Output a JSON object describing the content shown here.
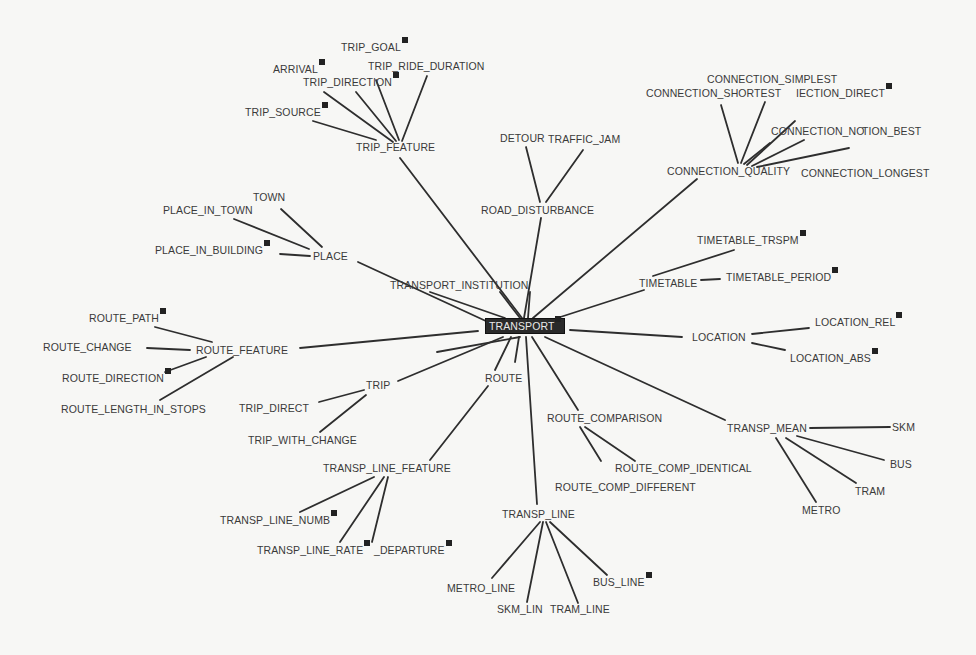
{
  "diagram": {
    "type": "concept-graph",
    "root": "TRANSPORT",
    "nodes": [
      {
        "id": "transport",
        "label": "TRANSPORT",
        "x": 485,
        "y": 326,
        "root": true,
        "badge": true
      },
      {
        "id": "trip_feature",
        "label": "TRIP_FEATURE",
        "x": 356,
        "y": 147
      },
      {
        "id": "trip_goal",
        "label": "TRIP_GOAL",
        "x": 341,
        "y": 47,
        "badge": true
      },
      {
        "id": "arrival",
        "label": "ARRIVAL",
        "x": 273,
        "y": 69,
        "badge": true
      },
      {
        "id": "trip_ride_duration",
        "label": "TRIP_RIDE_DURATION",
        "x": 368,
        "y": 66
      },
      {
        "id": "trip_direction",
        "label": "TRIP_DIRECTION",
        "x": 303,
        "y": 82,
        "badge": true
      },
      {
        "id": "trip_source",
        "label": "TRIP_SOURCE",
        "x": 245,
        "y": 112,
        "badge": true
      },
      {
        "id": "detour",
        "label": "DETOUR",
        "x": 500,
        "y": 138
      },
      {
        "id": "traffic_jam",
        "label": "TRAFFIC_JAM",
        "x": 548,
        "y": 139
      },
      {
        "id": "road_disturbance",
        "label": "ROAD_DISTURBANCE",
        "x": 481,
        "y": 210
      },
      {
        "id": "connection_quality",
        "label": "CONNECTION_QUALITY",
        "x": 667,
        "y": 171
      },
      {
        "id": "connection_simplest",
        "label": "CONNECTION_SIMPLEST",
        "x": 707,
        "y": 79
      },
      {
        "id": "connection_shortest",
        "label": "CONNECTION_SHORTEST",
        "x": 646,
        "y": 93
      },
      {
        "id": "connection_direct",
        "label": "CONNECTION_DIRECT",
        "x": 796,
        "y": 93,
        "badge": true,
        "display": "IECTION_DIRECT"
      },
      {
        "id": "connection_no",
        "label": "CONNECTION_NO",
        "x": 771,
        "y": 131
      },
      {
        "id": "connection_best",
        "label": "CONNECTION_BEST",
        "x": 862,
        "y": 131,
        "display": "TION_BEST"
      },
      {
        "id": "connection_longest",
        "label": "CONNECTION_LONGEST",
        "x": 801,
        "y": 173
      },
      {
        "id": "town",
        "label": "TOWN",
        "x": 253,
        "y": 197
      },
      {
        "id": "place_in_town",
        "label": "PLACE_IN_TOWN",
        "x": 163,
        "y": 210
      },
      {
        "id": "place_in_building",
        "label": "PLACE_IN_BUILDING",
        "x": 155,
        "y": 250,
        "badge": true
      },
      {
        "id": "place",
        "label": "PLACE",
        "x": 313,
        "y": 256
      },
      {
        "id": "transport_institution",
        "label": "TRANSPORT_INSTITUTION",
        "x": 390,
        "y": 285
      },
      {
        "id": "timetable",
        "label": "TIMETABLE",
        "x": 639,
        "y": 283
      },
      {
        "id": "timetable_trspm",
        "label": "TIMETABLE_TRSPM",
        "x": 697,
        "y": 240,
        "badge": true
      },
      {
        "id": "timetable_period",
        "label": "TIMETABLE_PERIOD",
        "x": 726,
        "y": 277,
        "badge": true
      },
      {
        "id": "location",
        "label": "LOCATION",
        "x": 692,
        "y": 337
      },
      {
        "id": "location_rel",
        "label": "LOCATION_REL",
        "x": 815,
        "y": 322,
        "badge": true
      },
      {
        "id": "location_abs",
        "label": "LOCATION_ABS",
        "x": 790,
        "y": 358,
        "badge": true
      },
      {
        "id": "route_feature",
        "label": "ROUTE_FEATURE",
        "x": 196,
        "y": 350
      },
      {
        "id": "route_path",
        "label": "ROUTE_PATH",
        "x": 89,
        "y": 318,
        "badge": true
      },
      {
        "id": "route_change",
        "label": "ROUTE_CHANGE",
        "x": 43,
        "y": 347
      },
      {
        "id": "route_direction",
        "label": "ROUTE_DIRECTION",
        "x": 62,
        "y": 378,
        "badge": true
      },
      {
        "id": "route_length_in_stops",
        "label": "ROUTE_LENGTH_IN_STOPS",
        "x": 61,
        "y": 409
      },
      {
        "id": "route",
        "label": "ROUTE",
        "x": 485,
        "y": 378
      },
      {
        "id": "trip",
        "label": "TRIP",
        "x": 366,
        "y": 385
      },
      {
        "id": "trip_direct",
        "label": "TRIP_DIRECT",
        "x": 239,
        "y": 408
      },
      {
        "id": "trip_with_change",
        "label": "TRIP_WITH_CHANGE",
        "x": 248,
        "y": 440
      },
      {
        "id": "transp_line_feature",
        "label": "TRANSP_LINE_FEATURE",
        "x": 323,
        "y": 468
      },
      {
        "id": "transp_line_numb",
        "label": "TRANSP_LINE_NUMB",
        "x": 220,
        "y": 520,
        "badge": true
      },
      {
        "id": "transp_line_rate",
        "label": "TRANSP_LINE_RATE",
        "x": 257,
        "y": 550,
        "badge": true
      },
      {
        "id": "departure",
        "label": "DEPARTURE",
        "x": 374,
        "y": 550,
        "badge": true,
        "display": "_DEPARTURE"
      },
      {
        "id": "route_comparison",
        "label": "ROUTE_COMPARISON",
        "x": 547,
        "y": 418
      },
      {
        "id": "route_comp_identical",
        "label": "ROUTE_COMP_IDENTICAL",
        "x": 615,
        "y": 468
      },
      {
        "id": "route_comp_different",
        "label": "ROUTE_COMP_DIFFERENT",
        "x": 555,
        "y": 487
      },
      {
        "id": "transp_mean",
        "label": "TRANSP_MEAN",
        "x": 727,
        "y": 428
      },
      {
        "id": "skm",
        "label": "SKM",
        "x": 892,
        "y": 427
      },
      {
        "id": "bus",
        "label": "BUS",
        "x": 890,
        "y": 464
      },
      {
        "id": "tram",
        "label": "TRAM",
        "x": 855,
        "y": 491
      },
      {
        "id": "metro",
        "label": "METRO",
        "x": 802,
        "y": 510
      },
      {
        "id": "transp_line",
        "label": "TRANSP_LINE",
        "x": 502,
        "y": 514
      },
      {
        "id": "metro_line",
        "label": "METRO_LINE",
        "x": 447,
        "y": 588
      },
      {
        "id": "skm_line",
        "label": "SKM_LINE",
        "x": 497,
        "y": 609,
        "display": "SKM_LIN"
      },
      {
        "id": "tram_line",
        "label": "TRAM_LINE",
        "x": 550,
        "y": 609
      },
      {
        "id": "bus_line",
        "label": "BUS_LINE",
        "x": 593,
        "y": 582,
        "badge": true
      }
    ],
    "edges": [
      {
        "x1": 522,
        "y1": 318,
        "x2": 400,
        "y2": 158
      },
      {
        "x1": 524,
        "y1": 318,
        "x2": 541,
        "y2": 218
      },
      {
        "x1": 533,
        "y1": 318,
        "x2": 697,
        "y2": 179
      },
      {
        "x1": 505,
        "y1": 318,
        "x2": 430,
        "y2": 292
      },
      {
        "x1": 520,
        "y1": 318,
        "x2": 500,
        "y2": 292
      },
      {
        "x1": 528,
        "y1": 318,
        "x2": 530,
        "y2": 292
      },
      {
        "x1": 488,
        "y1": 322,
        "x2": 358,
        "y2": 262
      },
      {
        "x1": 548,
        "y1": 321,
        "x2": 644,
        "y2": 290
      },
      {
        "x1": 570,
        "y1": 330,
        "x2": 682,
        "y2": 337
      },
      {
        "x1": 478,
        "y1": 331,
        "x2": 300,
        "y2": 348
      },
      {
        "x1": 503,
        "y1": 337,
        "x2": 398,
        "y2": 381
      },
      {
        "x1": 511,
        "y1": 337,
        "x2": 495,
        "y2": 370
      },
      {
        "x1": 519,
        "y1": 337,
        "x2": 515,
        "y2": 362
      },
      {
        "x1": 526,
        "y1": 337,
        "x2": 537,
        "y2": 504
      },
      {
        "x1": 532,
        "y1": 337,
        "x2": 578,
        "y2": 410
      },
      {
        "x1": 545,
        "y1": 337,
        "x2": 725,
        "y2": 420
      },
      {
        "x1": 520,
        "y1": 337,
        "x2": 437,
        "y2": 352
      },
      {
        "x1": 488,
        "y1": 386,
        "x2": 430,
        "y2": 460
      },
      {
        "x1": 399,
        "y1": 140,
        "x2": 376,
        "y2": 80
      },
      {
        "x1": 396,
        "y1": 141,
        "x2": 356,
        "y2": 92
      },
      {
        "x1": 393,
        "y1": 142,
        "x2": 324,
        "y2": 92
      },
      {
        "x1": 402,
        "y1": 141,
        "x2": 427,
        "y2": 76
      },
      {
        "x1": 376,
        "y1": 140,
        "x2": 313,
        "y2": 121
      },
      {
        "x1": 540,
        "y1": 202,
        "x2": 526,
        "y2": 147
      },
      {
        "x1": 546,
        "y1": 202,
        "x2": 583,
        "y2": 150
      },
      {
        "x1": 738,
        "y1": 163,
        "x2": 721,
        "y2": 105
      },
      {
        "x1": 741,
        "y1": 163,
        "x2": 765,
        "y2": 102
      },
      {
        "x1": 747,
        "y1": 165,
        "x2": 795,
        "y2": 121
      },
      {
        "x1": 752,
        "y1": 166,
        "x2": 804,
        "y2": 140
      },
      {
        "x1": 757,
        "y1": 167,
        "x2": 849,
        "y2": 148
      },
      {
        "x1": 744,
        "y1": 164,
        "x2": 770,
        "y2": 143
      },
      {
        "x1": 322,
        "y1": 247,
        "x2": 281,
        "y2": 209
      },
      {
        "x1": 309,
        "y1": 249,
        "x2": 234,
        "y2": 219
      },
      {
        "x1": 310,
        "y1": 256,
        "x2": 280,
        "y2": 254
      },
      {
        "x1": 653,
        "y1": 276,
        "x2": 734,
        "y2": 250
      },
      {
        "x1": 701,
        "y1": 280,
        "x2": 720,
        "y2": 279
      },
      {
        "x1": 752,
        "y1": 334,
        "x2": 809,
        "y2": 328
      },
      {
        "x1": 752,
        "y1": 343,
        "x2": 785,
        "y2": 350
      },
      {
        "x1": 212,
        "y1": 342,
        "x2": 155,
        "y2": 327
      },
      {
        "x1": 147,
        "y1": 348,
        "x2": 190,
        "y2": 350
      },
      {
        "x1": 206,
        "y1": 357,
        "x2": 165,
        "y2": 372
      },
      {
        "x1": 233,
        "y1": 357,
        "x2": 160,
        "y2": 400
      },
      {
        "x1": 364,
        "y1": 390,
        "x2": 319,
        "y2": 402
      },
      {
        "x1": 366,
        "y1": 395,
        "x2": 320,
        "y2": 432
      },
      {
        "x1": 374,
        "y1": 477,
        "x2": 300,
        "y2": 512
      },
      {
        "x1": 384,
        "y1": 477,
        "x2": 340,
        "y2": 542
      },
      {
        "x1": 388,
        "y1": 477,
        "x2": 372,
        "y2": 542
      },
      {
        "x1": 580,
        "y1": 427,
        "x2": 601,
        "y2": 461
      },
      {
        "x1": 585,
        "y1": 427,
        "x2": 635,
        "y2": 461
      },
      {
        "x1": 810,
        "y1": 428,
        "x2": 890,
        "y2": 427
      },
      {
        "x1": 797,
        "y1": 436,
        "x2": 884,
        "y2": 460
      },
      {
        "x1": 786,
        "y1": 438,
        "x2": 856,
        "y2": 483
      },
      {
        "x1": 776,
        "y1": 438,
        "x2": 816,
        "y2": 502
      },
      {
        "x1": 540,
        "y1": 522,
        "x2": 492,
        "y2": 578
      },
      {
        "x1": 543,
        "y1": 522,
        "x2": 527,
        "y2": 602
      },
      {
        "x1": 546,
        "y1": 522,
        "x2": 578,
        "y2": 603
      },
      {
        "x1": 550,
        "y1": 522,
        "x2": 607,
        "y2": 575
      }
    ]
  }
}
